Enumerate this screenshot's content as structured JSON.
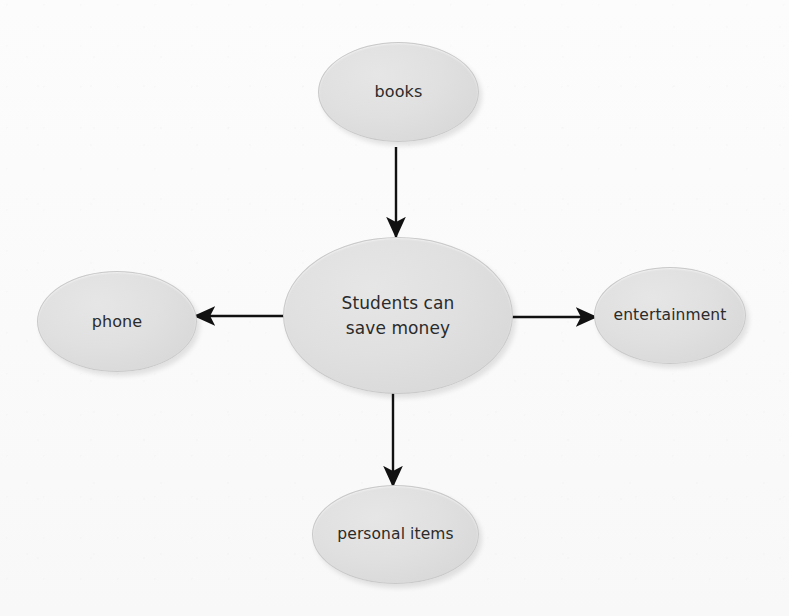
{
  "diagram": {
    "type": "concept-map",
    "title": "Students can save money",
    "background_color": "#fbfbfb",
    "node_fill_color": "#dcdcdc",
    "node_border_color": "#c9c9c9",
    "text_color": "#2b2b2b",
    "edge_color": "#111111",
    "center": {
      "id": "center",
      "label": "Students can\nsave money"
    },
    "branches": [
      {
        "id": "books",
        "label": "books",
        "position": "top",
        "arrow_direction": "down-to-center"
      },
      {
        "id": "phone",
        "label": "phone",
        "position": "left",
        "arrow_direction": "center-to-left"
      },
      {
        "id": "entertainment",
        "label": "entertainment",
        "position": "right",
        "arrow_direction": "center-to-right"
      },
      {
        "id": "personal-items",
        "label": "personal items",
        "position": "bottom",
        "arrow_direction": "center-to-bottom"
      }
    ],
    "edges": [
      {
        "id": "edge-books-center",
        "from": "books",
        "to": "center"
      },
      {
        "id": "edge-center-phone",
        "from": "center",
        "to": "phone"
      },
      {
        "id": "edge-center-entertainment",
        "from": "center",
        "to": "entertainment"
      },
      {
        "id": "edge-center-personal-items",
        "from": "center",
        "to": "personal-items"
      }
    ]
  }
}
